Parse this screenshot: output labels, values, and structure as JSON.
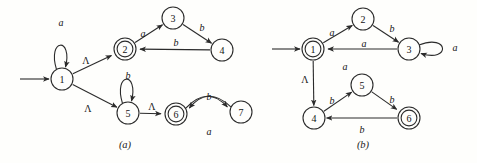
{
  "figure": {
    "type": "nfa-state-diagram-pair",
    "captions": [
      {
        "text": "(a)",
        "x": 125,
        "y": 144
      },
      {
        "text": "(b)",
        "x": 363,
        "y": 144
      }
    ],
    "colors": {
      "stroke": "#2b2b2b",
      "text": "#141414",
      "background": "#fefefc"
    }
  },
  "diagrams": [
    {
      "id": "a",
      "caption": "(a)",
      "start_state": "1",
      "accepting_states": [
        "2",
        "6"
      ],
      "states": [
        {
          "label": "1",
          "x": 62,
          "y": 79,
          "r": 11,
          "accepting": false
        },
        {
          "label": "2",
          "x": 125,
          "y": 49,
          "r": 11,
          "accepting": true
        },
        {
          "label": "3",
          "x": 173,
          "y": 18,
          "r": 11,
          "accepting": false
        },
        {
          "label": "4",
          "x": 222,
          "y": 50,
          "r": 11,
          "accepting": false
        },
        {
          "label": "5",
          "x": 128,
          "y": 113,
          "r": 11,
          "accepting": false
        },
        {
          "label": "6",
          "x": 176,
          "y": 114,
          "r": 11,
          "accepting": true
        },
        {
          "label": "7",
          "x": 241,
          "y": 112,
          "r": 11,
          "accepting": false
        }
      ],
      "transitions": [
        {
          "from": "1",
          "to": "1",
          "symbol": "a",
          "kind": "self-loop-up",
          "label_x": 61,
          "label_y": 22
        },
        {
          "from": "1",
          "to": "2",
          "symbol": "Λ",
          "kind": "straight",
          "label_x": 86,
          "label_y": 60
        },
        {
          "from": "1",
          "to": "5",
          "symbol": "Λ",
          "kind": "straight",
          "label_x": 88,
          "label_y": 108
        },
        {
          "from": "2",
          "to": "3",
          "symbol": "a",
          "kind": "straight",
          "label_x": 143,
          "label_y": 33
        },
        {
          "from": "3",
          "to": "4",
          "symbol": "b",
          "kind": "straight",
          "label_x": 202,
          "label_y": 27
        },
        {
          "from": "4",
          "to": "2",
          "symbol": "b",
          "kind": "straight",
          "label_x": 176,
          "label_y": 42
        },
        {
          "from": "5",
          "to": "5",
          "symbol": "b",
          "kind": "self-loop-up",
          "label_x": 128,
          "label_y": 75
        },
        {
          "from": "5",
          "to": "6",
          "symbol": "Λ",
          "kind": "straight",
          "label_x": 152,
          "label_y": 106
        },
        {
          "from": "6",
          "to": "7",
          "symbol": "b",
          "kind": "curve-above",
          "label_x": 209,
          "label_y": 96
        },
        {
          "from": "7",
          "to": "6",
          "symbol": "a",
          "kind": "curve-below",
          "label_x": 209,
          "label_y": 131
        }
      ],
      "start_arrow": {
        "x1": 20,
        "y1": 79,
        "x2": 49,
        "y2": 79
      }
    },
    {
      "id": "b",
      "caption": "(b)",
      "start_state": "1",
      "accepting_states": [
        "1",
        "6"
      ],
      "states": [
        {
          "label": "1",
          "x": 313,
          "y": 49,
          "r": 11,
          "accepting": true
        },
        {
          "label": "2",
          "x": 363,
          "y": 19,
          "r": 11,
          "accepting": false
        },
        {
          "label": "3",
          "x": 409,
          "y": 49,
          "r": 11,
          "accepting": false
        },
        {
          "label": "4",
          "x": 314,
          "y": 118,
          "r": 11,
          "accepting": false
        },
        {
          "label": "5",
          "x": 362,
          "y": 85,
          "r": 11,
          "accepting": false
        },
        {
          "label": "6",
          "x": 409,
          "y": 118,
          "r": 11,
          "accepting": true
        }
      ],
      "transitions": [
        {
          "from": "1",
          "to": "2",
          "symbol": "a",
          "kind": "straight",
          "label_x": 332,
          "label_y": 32
        },
        {
          "from": "2",
          "to": "3",
          "symbol": "b",
          "kind": "straight",
          "label_x": 392,
          "label_y": 28
        },
        {
          "from": "3",
          "to": "1",
          "symbol": "a",
          "kind": "straight",
          "label_x": 364,
          "label_y": 43
        },
        {
          "from": "3",
          "to": "3",
          "symbol": "a",
          "kind": "self-loop-right",
          "label_x": 455,
          "label_y": 47
        },
        {
          "from": "1",
          "to": "4",
          "symbol": "Λ",
          "kind": "straight",
          "label_x": 305,
          "label_y": 79
        },
        {
          "from": "4",
          "to": "5",
          "symbol": "b",
          "kind": "straight",
          "label_x": 332,
          "label_y": 100
        },
        {
          "from": "5",
          "to": "6",
          "symbol": "b",
          "kind": "straight",
          "label_x": 392,
          "label_y": 99
        },
        {
          "from": "6",
          "to": "4",
          "symbol": "b",
          "kind": "straight",
          "label_x": 362,
          "label_y": 129
        }
      ],
      "extra_labels": [
        {
          "text": "a",
          "x": 345,
          "y": 66
        }
      ],
      "start_arrow": {
        "x1": 272,
        "y1": 49,
        "x2": 300,
        "y2": 49
      }
    }
  ]
}
